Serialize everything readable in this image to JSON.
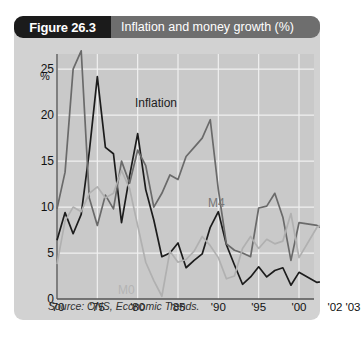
{
  "figure": {
    "tag": "Figure 26.3",
    "title": "Inflation and money growth (%)",
    "source": "Source: ONS, Economic Trends."
  },
  "colors": {
    "panel_background": "#d2d2d2",
    "plot_background": "#c9c9c9",
    "tag_background": "#1b1b1b",
    "title_background": "#6e6e6e",
    "gridline": "#f0f0f0",
    "axis": "#555555",
    "inflation": "#1c1c1c",
    "m4": "#6a6a6a",
    "m0": "#b0b0b0"
  },
  "chart_data": {
    "type": "line",
    "title": "Inflation and money growth (%)",
    "xlabel": "",
    "ylabel": "%",
    "ylim": [
      0,
      26
    ],
    "yticks": [
      0,
      5,
      10,
      15,
      20,
      25
    ],
    "ytick_labels": [
      "0",
      "5",
      "10",
      "15",
      "20",
      "25"
    ],
    "xlim": [
      1970,
      2003
    ],
    "xticks": [
      1970,
      1975,
      1980,
      1985,
      1990,
      1995,
      2000,
      2002,
      2003
    ],
    "xtick_labels": [
      "'70",
      "'75",
      "'80",
      "'85",
      "'90",
      "'95",
      "'00",
      "'02",
      "'03"
    ],
    "grid": true,
    "legend": "inline-labels",
    "annotations": [
      {
        "text": "Inflation",
        "x": 1977.5,
        "y": 21.5
      },
      {
        "text": "M4",
        "x": 1991.5,
        "y": 11.5
      },
      {
        "text": "M0",
        "x": 1981.0,
        "y": 2.6
      }
    ],
    "x": [
      1970,
      1971,
      1972,
      1973,
      1974,
      1975,
      1976,
      1977,
      1978,
      1979,
      1980,
      1981,
      1982,
      1983,
      1984,
      1985,
      1986,
      1987,
      1988,
      1989,
      1990,
      1991,
      1992,
      1993,
      1994,
      1995,
      1996,
      1997,
      1998,
      1999,
      2000,
      2001,
      2002,
      2003
    ],
    "series": [
      {
        "name": "Inflation",
        "color": "#1c1c1c",
        "values": [
          6.4,
          9.4,
          7.1,
          9.2,
          16.0,
          24.2,
          16.5,
          15.8,
          8.3,
          13.4,
          18.0,
          11.9,
          8.6,
          4.6,
          5.0,
          6.1,
          3.4,
          4.2,
          4.9,
          7.8,
          9.5,
          5.9,
          3.7,
          1.6,
          2.4,
          3.5,
          2.4,
          3.1,
          3.4,
          1.5,
          2.9,
          1.8,
          2.2,
          2.8
        ]
      },
      {
        "name": "M4",
        "color": "#6a6a6a",
        "values": [
          9.8,
          13.8,
          25.0,
          27.0,
          11.0,
          8.0,
          11.3,
          9.8,
          15.0,
          12.6,
          16.2,
          14.5,
          10.0,
          11.5,
          13.5,
          13.0,
          15.5,
          16.5,
          17.5,
          19.5,
          11.9,
          6.0,
          5.3,
          5.0,
          4.6,
          9.9,
          10.1,
          11.5,
          8.9,
          4.2,
          8.3,
          8.0,
          7.0,
          6.8
        ]
      },
      {
        "name": "M0",
        "color": "#b0b0b0",
        "values": [
          3.8,
          8.5,
          10.0,
          9.5,
          11.5,
          12.2,
          11.0,
          11.5,
          14.0,
          12.0,
          8.0,
          4.0,
          2.0,
          0.3,
          5.2,
          4.0,
          4.3,
          5.2,
          6.8,
          5.8,
          4.5,
          2.2,
          2.5,
          5.5,
          6.8,
          5.5,
          6.5,
          6.0,
          6.3,
          9.3,
          4.5,
          7.8,
          9.0,
          8.6
        ]
      }
    ]
  }
}
